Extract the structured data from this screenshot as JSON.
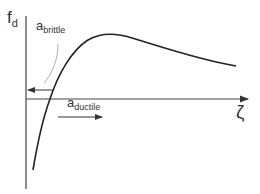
{
  "diagram": {
    "y_axis": {
      "symbol": "f",
      "subscript": "d"
    },
    "x_axis": {
      "symbol": "ζ"
    },
    "annotations": [
      {
        "id": "brittle",
        "symbol": "a",
        "subscript": "brittle",
        "arrow_direction": "left"
      },
      {
        "id": "ductile",
        "symbol": "a",
        "subscript": "ductile",
        "arrow_direction": "right"
      }
    ],
    "colors": {
      "line": "#222222",
      "axis": "#444444",
      "leader": "#888888"
    }
  }
}
